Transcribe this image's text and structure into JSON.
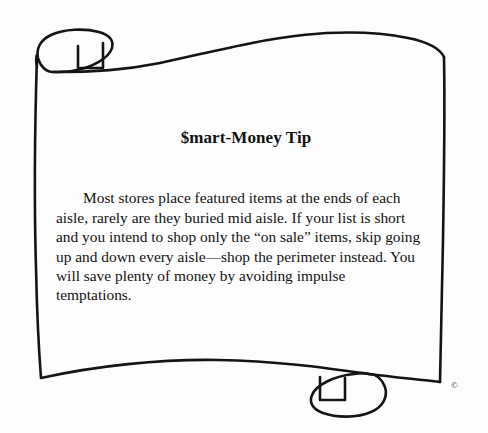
{
  "figure": {
    "kind": "illustrated-scroll-note",
    "background_color": "#fdfdfd",
    "ink_color": "#111111"
  },
  "scroll": {
    "title": "$mart-Money Tip",
    "body": "Most stores place featured items at the ends of each aisle, rarely are they buried mid aisle. If your list is short and you intend to shop only the “on sale” items, skip going up and down every aisle—shop the perimeter instead. You will save plenty of money by avoiding impulse temptations.",
    "copyright": "©",
    "icons": {
      "top_left_curl": "scroll-curl-icon",
      "bottom_right_curl": "scroll-curl-icon",
      "copyright": "copyright-icon"
    }
  }
}
